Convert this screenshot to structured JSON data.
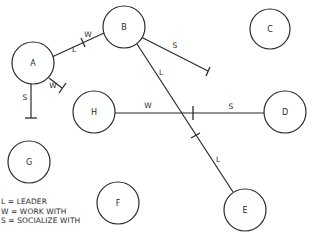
{
  "diagram": {
    "type": "sociogram",
    "colors": {
      "stroke": "#2a2a2a",
      "background": "#ffffff"
    },
    "nodes": [
      {
        "id": "A",
        "label": "A",
        "cx": 33,
        "cy": 63,
        "r": 21
      },
      {
        "id": "B",
        "label": "B",
        "cx": 124,
        "cy": 27,
        "r": 21
      },
      {
        "id": "C",
        "label": "C",
        "cx": 270,
        "cy": 29,
        "r": 20
      },
      {
        "id": "D",
        "label": "D",
        "cx": 285,
        "cy": 112,
        "r": 21
      },
      {
        "id": "E",
        "label": "E",
        "cx": 245,
        "cy": 210,
        "r": 21
      },
      {
        "id": "F",
        "label": "F",
        "cx": 118,
        "cy": 203,
        "r": 21
      },
      {
        "id": "G",
        "label": "G",
        "cx": 29,
        "cy": 162,
        "r": 21
      },
      {
        "id": "H",
        "label": "H",
        "cx": 94,
        "cy": 112,
        "r": 21
      }
    ],
    "edges": [
      {
        "id": "A-B",
        "from": "A",
        "to": "B",
        "x1": 52,
        "y1": 57,
        "x2": 104,
        "y2": 33,
        "ticks": [
          {
            "x1": 81,
            "y1": 38,
            "x2": 85,
            "y2": 47
          }
        ],
        "labels": [
          {
            "text": "W",
            "x": 88,
            "y": 35
          },
          {
            "text": "L",
            "x": 74,
            "y": 50
          }
        ]
      },
      {
        "id": "A-W",
        "from": "A",
        "to": null,
        "x1": 49,
        "y1": 78,
        "x2": 62,
        "y2": 88,
        "ticks": [
          {
            "x1": 59,
            "y1": 93,
            "x2": 66,
            "y2": 83
          }
        ],
        "labels": [
          {
            "text": "W",
            "x": 53,
            "y": 86
          }
        ]
      },
      {
        "id": "A-S",
        "from": "A",
        "to": null,
        "x1": 31,
        "y1": 84,
        "x2": 31,
        "y2": 118,
        "ticks": [
          {
            "x1": 25,
            "y1": 118,
            "x2": 37,
            "y2": 118
          }
        ],
        "labels": [
          {
            "text": "S",
            "x": 25,
            "y": 98
          }
        ]
      },
      {
        "id": "B-S",
        "from": "B",
        "to": null,
        "x1": 141,
        "y1": 37,
        "x2": 208,
        "y2": 71,
        "ticks": [
          {
            "x1": 206,
            "y1": 76,
            "x2": 210,
            "y2": 67
          }
        ],
        "labels": [
          {
            "text": "S",
            "x": 175,
            "y": 46
          }
        ]
      },
      {
        "id": "B-E",
        "from": "B",
        "to": "E",
        "x1": 137,
        "y1": 44,
        "x2": 233,
        "y2": 192,
        "ticks": [
          {
            "x1": 191,
            "y1": 138,
            "x2": 200,
            "y2": 133
          }
        ],
        "labels": [
          {
            "text": "L",
            "x": 161,
            "y": 73
          },
          {
            "text": "L",
            "x": 218,
            "y": 160
          }
        ]
      },
      {
        "id": "H-D",
        "from": "H",
        "to": "D",
        "x1": 115,
        "y1": 113,
        "x2": 264,
        "y2": 113,
        "ticks": [
          {
            "x1": 193,
            "y1": 106,
            "x2": 193,
            "y2": 120
          }
        ],
        "labels": [
          {
            "text": "W",
            "x": 148,
            "y": 106
          },
          {
            "text": "S",
            "x": 231,
            "y": 107
          }
        ]
      }
    ],
    "legend": [
      {
        "key": "L",
        "text": "L = LEADER"
      },
      {
        "key": "W",
        "text": "W = WORK WITH"
      },
      {
        "key": "S",
        "text": "S = SOCIALIZE WITH"
      }
    ]
  }
}
